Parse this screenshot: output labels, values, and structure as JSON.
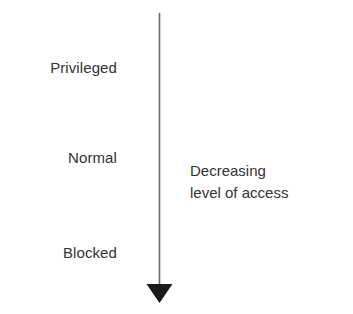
{
  "diagram": {
    "type": "vertical-axis-annotation",
    "background_color": "#ffffff",
    "text_color": "#333333",
    "arrow": {
      "name": "decreasing-access-arrow",
      "direction": "downward",
      "shaft_color": "#6a6a6a",
      "head_color": "#1a1a1a",
      "head_shape": "filled-triangle"
    },
    "tiers": [
      {
        "id": "privileged",
        "label": "Privileged"
      },
      {
        "id": "normal",
        "label": "Normal"
      },
      {
        "id": "blocked",
        "label": "Blocked"
      }
    ],
    "annotation": {
      "name": "decreasing-level-of-access-caption",
      "line1": "Decreasing",
      "line2": "level of access"
    }
  }
}
